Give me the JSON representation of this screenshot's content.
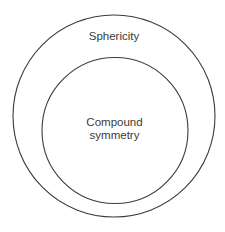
{
  "diagram": {
    "type": "nested-sets",
    "outer_set": {
      "label": "Sphericity",
      "stroke": "#3c3c3c"
    },
    "inner_set": {
      "label_line1": "Compound",
      "label_line2": "symmetry",
      "stroke": "#3c3c3c"
    },
    "relationship": "Compound symmetry is a subset of Sphericity"
  }
}
